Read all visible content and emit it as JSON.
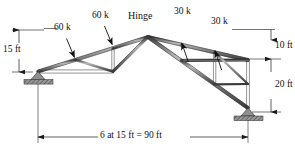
{
  "diagram": {
    "type": "structural-truss-free-body-diagram",
    "units": "ft, kips"
  },
  "labels": {
    "hinge": "Hinge",
    "load_left_1": "60 k",
    "load_left_2": "60 k",
    "load_right_1": "30 k",
    "load_right_2": "30 k",
    "dim_left_height": "15 ft",
    "dim_right_upper": "10 ft",
    "dim_right_lower": "20 ft",
    "dim_span": "6 at 15 ft = 90 ft"
  },
  "loads": [
    {
      "name": "load-left-outer",
      "magnitude": "60 k",
      "value": 60,
      "unit": "k",
      "side": "left"
    },
    {
      "name": "load-left-inner",
      "magnitude": "60 k",
      "value": 60,
      "unit": "k",
      "side": "left"
    },
    {
      "name": "load-right-inner",
      "magnitude": "30 k",
      "value": 30,
      "unit": "k",
      "side": "right"
    },
    {
      "name": "load-right-outer",
      "magnitude": "30 k",
      "value": 30,
      "unit": "k",
      "side": "right"
    }
  ],
  "dimensions": [
    {
      "name": "left-height",
      "text": "15 ft",
      "value": 15,
      "unit": "ft"
    },
    {
      "name": "right-upper",
      "text": "10 ft",
      "value": 10,
      "unit": "ft"
    },
    {
      "name": "right-lower",
      "text": "20 ft",
      "value": 20,
      "unit": "ft"
    },
    {
      "name": "span",
      "text": "6 at 15 ft = 90 ft",
      "panels": 6,
      "panel_length": 15,
      "total": 90,
      "unit": "ft"
    }
  ],
  "supports": [
    {
      "name": "left-support",
      "type": "pin-hatched"
    },
    {
      "name": "right-support",
      "type": "pin-hatched"
    }
  ],
  "colors": {
    "member": "#6f6f6f",
    "member_edge": "#2b2b2b",
    "support_fill": "#8a8a8a",
    "dimension": "#1a1a1a",
    "text": "#111111"
  }
}
